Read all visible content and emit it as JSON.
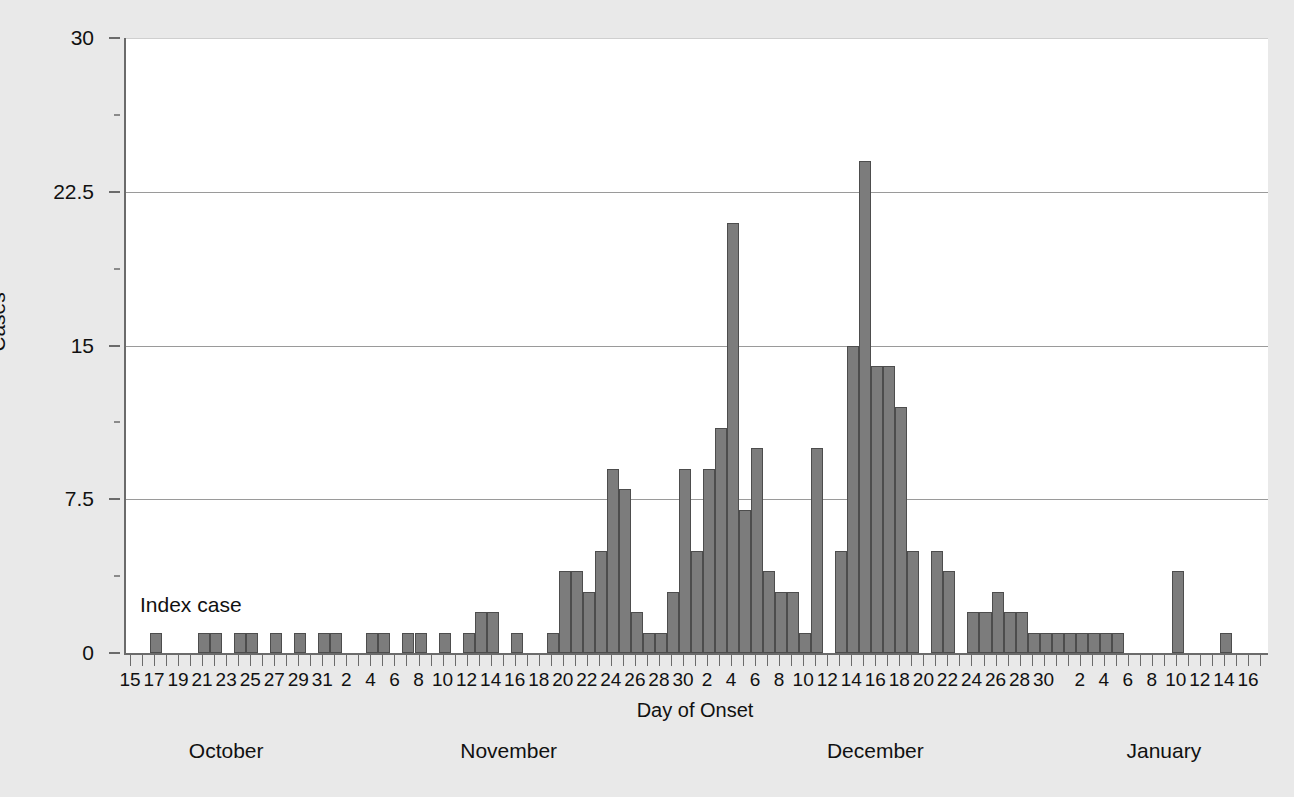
{
  "chart_data": {
    "type": "bar",
    "title": "",
    "xlabel": "Day of Onset",
    "ylabel": "Cases",
    "ylim": [
      0,
      30
    ],
    "y_ticks": [
      "0",
      "7.5",
      "15",
      "22.5",
      "30"
    ],
    "y_tick_values": [
      0,
      7.5,
      15,
      22.5,
      30
    ],
    "grid": true,
    "legend": false,
    "annotations": [
      {
        "text": "Index case",
        "points_to": "October 17"
      }
    ],
    "month_groups": [
      {
        "label": "October",
        "first_day": 15,
        "last_day": 31
      },
      {
        "label": "November",
        "first_day": 1,
        "last_day": 30
      },
      {
        "label": "December",
        "first_day": 1,
        "last_day": 31
      },
      {
        "label": "January",
        "first_day": 1,
        "last_day": 17
      }
    ],
    "tick_label_step": 2,
    "categories": [
      "Oct 15",
      "Oct 16",
      "Oct 17",
      "Oct 18",
      "Oct 19",
      "Oct 20",
      "Oct 21",
      "Oct 22",
      "Oct 23",
      "Oct 24",
      "Oct 25",
      "Oct 26",
      "Oct 27",
      "Oct 28",
      "Oct 29",
      "Oct 30",
      "Oct 31",
      "Nov 1",
      "Nov 2",
      "Nov 3",
      "Nov 4",
      "Nov 5",
      "Nov 6",
      "Nov 7",
      "Nov 8",
      "Nov 9",
      "Nov 10",
      "Nov 11",
      "Nov 12",
      "Nov 13",
      "Nov 14",
      "Nov 15",
      "Nov 16",
      "Nov 17",
      "Nov 18",
      "Nov 19",
      "Nov 20",
      "Nov 21",
      "Nov 22",
      "Nov 23",
      "Nov 24",
      "Nov 25",
      "Nov 26",
      "Nov 27",
      "Nov 28",
      "Nov 29",
      "Nov 30",
      "Dec 1",
      "Dec 2",
      "Dec 3",
      "Dec 4",
      "Dec 5",
      "Dec 6",
      "Dec 7",
      "Dec 8",
      "Dec 9",
      "Dec 10",
      "Dec 11",
      "Dec 12",
      "Dec 13",
      "Dec 14",
      "Dec 15",
      "Dec 16",
      "Dec 17",
      "Dec 18",
      "Dec 19",
      "Dec 20",
      "Dec 21",
      "Dec 22",
      "Dec 23",
      "Dec 24",
      "Dec 25",
      "Dec 26",
      "Dec 27",
      "Dec 28",
      "Dec 29",
      "Dec 30",
      "Dec 31",
      "Jan 1",
      "Jan 2",
      "Jan 3",
      "Jan 4",
      "Jan 5",
      "Jan 6",
      "Jan 7",
      "Jan 8",
      "Jan 9",
      "Jan 10",
      "Jan 11",
      "Jan 12",
      "Jan 13",
      "Jan 14",
      "Jan 15",
      "Jan 16",
      "Jan 17"
    ],
    "values": [
      0,
      0,
      1,
      0,
      0,
      0,
      1,
      1,
      0,
      1,
      1,
      0,
      1,
      0,
      1,
      0,
      1,
      1,
      0,
      0,
      1,
      1,
      0,
      1,
      1,
      0,
      1,
      0,
      1,
      2,
      2,
      0,
      1,
      0,
      0,
      1,
      4,
      4,
      3,
      5,
      9,
      8,
      2,
      1,
      1,
      3,
      9,
      5,
      9,
      11,
      21,
      7,
      10,
      4,
      3,
      3,
      1,
      10,
      0,
      5,
      15,
      24,
      14,
      14,
      12,
      5,
      0,
      5,
      4,
      0,
      2,
      2,
      3,
      2,
      2,
      1,
      1,
      1,
      1,
      1,
      1,
      1,
      1,
      0,
      0,
      0,
      0,
      4,
      0,
      0,
      0,
      1,
      0,
      0,
      0
    ]
  },
  "axes": {
    "y_title": "Cases",
    "x_title": "Day of Onset"
  }
}
